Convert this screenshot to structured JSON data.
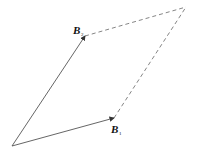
{
  "diagram": {
    "type": "vector-parallelogram",
    "vectors": [
      {
        "id": "B1",
        "label": "B",
        "subscript": "1"
      },
      {
        "id": "B2",
        "label": "B",
        "subscript": "2"
      }
    ],
    "colors": {
      "line": "#555555",
      "text": "#111111",
      "background": "#ffffff"
    }
  }
}
